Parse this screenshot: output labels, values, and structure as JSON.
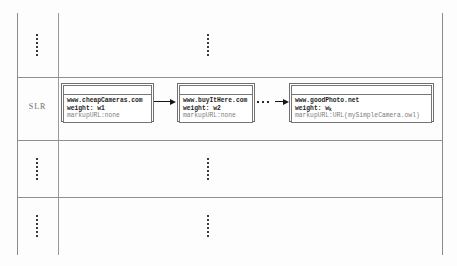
{
  "figure": {
    "type": "table-with-linked-nodes-diagram",
    "row_label": "SLR"
  },
  "rows": [
    {
      "id": "row-above",
      "narrow_cell": "vertical-ellipsis",
      "main_cell": "vertical-ellipsis"
    },
    {
      "id": "row-slr",
      "narrow_cell": "SLR",
      "main_cell": "node-chain"
    },
    {
      "id": "row-below1",
      "narrow_cell": "vertical-ellipsis",
      "main_cell": "vertical-ellipsis"
    },
    {
      "id": "row-below2",
      "narrow_cell": "vertical-ellipsis",
      "main_cell": "vertical-ellipsis"
    }
  ],
  "nodes": [
    {
      "id": "node-1",
      "url": "www.cheapCameras.com",
      "weight": "weight: w1",
      "markup": "markupURL:none"
    },
    {
      "id": "node-2",
      "url": "www.buyItHere.com",
      "weight": "weight: w2",
      "markup": "markupURL:none"
    },
    {
      "id": "node-3",
      "url": "www.goodPhoto.net",
      "weight_prefix": "weight: w",
      "weight_subscript": "k",
      "markup": "markupURL:URL(mySimpleCamera.owl)"
    }
  ],
  "connectors": [
    {
      "id": "arrow-1",
      "kind": "arrow",
      "from": "node-1",
      "to": "node-2"
    },
    {
      "id": "ellipsis-1",
      "kind": "horizontal-ellipsis",
      "text": "..."
    },
    {
      "id": "arrow-2",
      "kind": "arrow",
      "from": "ellipsis-1",
      "to": "node-3"
    }
  ],
  "colors": {
    "rule": "#8f8f8f",
    "node_border": "#6f6f6f",
    "text": "#1d1d1d",
    "faint_text": "#7e7e7e",
    "arrow": "#151515",
    "label": "#6e6e6e",
    "background": "#fdfdfd"
  }
}
